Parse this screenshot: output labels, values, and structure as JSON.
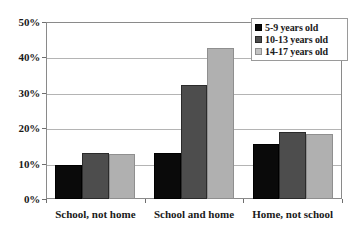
{
  "chart_data": {
    "type": "bar",
    "title": "",
    "subtitle": "",
    "xlabel": "",
    "ylabel": "",
    "categories": [
      "School, not home",
      "School and home",
      "Home, not school"
    ],
    "series": [
      {
        "name": "5-9 years old",
        "color": "#0a0a0a",
        "values": [
          9.5,
          13.0,
          15.5
        ]
      },
      {
        "name": "10-13 years old",
        "color": "#4d4d4d",
        "values": [
          13.0,
          32.3,
          18.8
        ]
      },
      {
        "name": "14-17 years old",
        "color": "#b0b0b0",
        "values": [
          12.8,
          42.8,
          18.5
        ]
      }
    ],
    "ylim": [
      0,
      50
    ],
    "ytick_values": [
      0,
      10,
      20,
      30,
      40,
      50
    ],
    "ytick_labels": [
      "0%",
      "10%",
      "20%",
      "30%",
      "40%",
      "50%"
    ],
    "grid": true,
    "grid_axis": "y",
    "legend_position": "top-right",
    "value_suffix": "%"
  },
  "axes": {
    "frame_color": "#8a8a8a",
    "gridline_color": "#b4b4b4",
    "tick_color": "#6e6e6e"
  }
}
